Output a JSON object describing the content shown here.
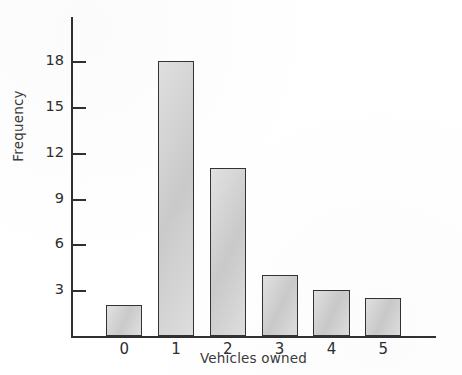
{
  "chart_data": {
    "type": "bar",
    "title": "",
    "subtitle": "",
    "xlabel": "Vehicles owned",
    "ylabel": "Frequency",
    "categories": [
      "0",
      "1",
      "2",
      "3",
      "4",
      "5"
    ],
    "values": [
      2,
      18,
      11,
      4,
      3,
      2.5
    ],
    "series": [
      {
        "name": "Frequency",
        "values": [
          2,
          18,
          11,
          4,
          3,
          2.5
        ]
      }
    ],
    "ytick_labels": [
      "3",
      "6",
      "9",
      "12",
      "15",
      "18"
    ],
    "ytick_values": [
      3,
      6,
      9,
      12,
      15,
      18
    ],
    "xtick_labels": [
      "0",
      "1",
      "2",
      "3",
      "4",
      "5"
    ],
    "ylim": [
      0,
      21
    ],
    "xlim": [
      -0.5,
      5.5
    ],
    "grid": false,
    "legend": false,
    "legend_position": "none",
    "bar_fill_color": "#d2d2d2",
    "bar_edge_color": "#333333",
    "axis_color": "#303030",
    "background_color": "#ffffff"
  }
}
